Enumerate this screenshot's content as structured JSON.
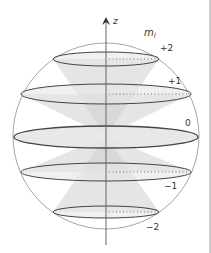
{
  "diagram": {
    "axis_label": "z",
    "quantum_number_label": "m",
    "quantum_number_subscript": "l",
    "levels": [
      {
        "m": 2,
        "label": "+2"
      },
      {
        "m": 1,
        "label": "+1"
      },
      {
        "m": 0,
        "label": "0"
      },
      {
        "m": -1,
        "label": "−1"
      },
      {
        "m": -2,
        "label": "−2"
      }
    ],
    "colors": {
      "sphere": "#9a9a9a",
      "ellipse_stroke": "#444444",
      "ellipse_fill": "#e6e6e6",
      "cone": "#d0d0d0",
      "axis": "#666666",
      "dots": "#777777",
      "border": "#999999"
    }
  }
}
